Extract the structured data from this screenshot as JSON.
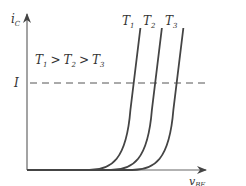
{
  "figure": {
    "y_axis_label": {
      "main": "i",
      "sub": "C"
    },
    "x_axis_label": {
      "main": "v",
      "sub": "BE"
    },
    "current_level_label": "I",
    "temperature_relation": {
      "t1": {
        "main": "T",
        "sub": "1"
      },
      "gt1": ">",
      "t2": {
        "main": "T",
        "sub": "2"
      },
      "gt2": ">",
      "t3": {
        "main": "T",
        "sub": "3"
      }
    },
    "curves": [
      {
        "name": "T1",
        "label_main": "T",
        "label_sub": "1",
        "turn_on_vbe": 0.6
      },
      {
        "name": "T2",
        "label_main": "T",
        "label_sub": "2",
        "turn_on_vbe": 0.72
      },
      {
        "name": "T3",
        "label_main": "T",
        "label_sub": "3",
        "turn_on_vbe": 0.84
      }
    ],
    "dashed_level_fraction": 0.56,
    "colors": {
      "curve": "#444444",
      "axis": "#666666",
      "dash": "#555555",
      "text": "#333333"
    }
  }
}
